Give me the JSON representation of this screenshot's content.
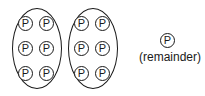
{
  "diagram": {
    "token_letter": "P",
    "token_icon": "circled-p-icon",
    "stroke_color": "#1a1a1a",
    "background_color": "#ffffff",
    "groups": [
      {
        "name": "group-1",
        "shape": "oval",
        "count": 6,
        "tokens": [
          {
            "letter": "P",
            "x": 18,
            "y": 16
          },
          {
            "letter": "P",
            "x": 39,
            "y": 16
          },
          {
            "letter": "P",
            "x": 18,
            "y": 41
          },
          {
            "letter": "P",
            "x": 39,
            "y": 41
          },
          {
            "letter": "P",
            "x": 18,
            "y": 66
          },
          {
            "letter": "P",
            "x": 39,
            "y": 66
          }
        ]
      },
      {
        "name": "group-2",
        "shape": "oval",
        "count": 6,
        "tokens": [
          {
            "letter": "P",
            "x": 74,
            "y": 16
          },
          {
            "letter": "P",
            "x": 95,
            "y": 16
          },
          {
            "letter": "P",
            "x": 74,
            "y": 41
          },
          {
            "letter": "P",
            "x": 95,
            "y": 41
          },
          {
            "letter": "P",
            "x": 74,
            "y": 66
          },
          {
            "letter": "P",
            "x": 95,
            "y": 66
          }
        ]
      }
    ],
    "remainder": {
      "count": 1,
      "letter": "P",
      "label": "(remainder)"
    }
  }
}
